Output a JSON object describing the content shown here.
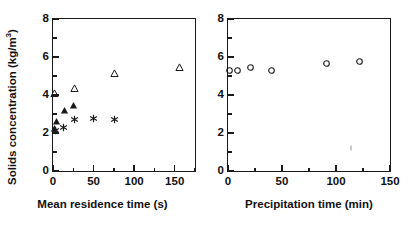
{
  "figure": {
    "background": "#ffffff",
    "foreground": "#1a1a1a"
  },
  "chart_data": [
    {
      "id": "left",
      "type": "scatter",
      "title": "",
      "xlabel": "Mean residence time (s)",
      "ylabel": "Solids concentration (kg/m",
      "ylabel_sup": "3",
      "ylabel_tail": ")",
      "ylabel_full": "Solids concentration (kg/m3 )",
      "xlim": [
        0,
        175
      ],
      "ylim": [
        0,
        8
      ],
      "xticks": [
        0,
        50,
        100,
        150
      ],
      "xticklabels": [
        "0",
        "50",
        "100",
        "150"
      ],
      "xminorticks": [
        25,
        75,
        125,
        175
      ],
      "yticks": [
        0,
        2,
        4,
        6,
        8
      ],
      "yticklabels": [
        "0",
        "2",
        "4",
        "6",
        "8"
      ],
      "yminorticks": [
        1,
        3,
        5,
        7
      ],
      "grid": false,
      "legend": "none",
      "series": [
        {
          "name": "open-triangle",
          "marker": "triangle-open",
          "color": "#1a1a1a",
          "points": [
            {
              "x": 1,
              "y": 4.1
            },
            {
              "x": 26,
              "y": 4.35
            },
            {
              "x": 75,
              "y": 5.15
            },
            {
              "x": 155,
              "y": 5.5
            }
          ]
        },
        {
          "name": "filled-triangle",
          "marker": "triangle-filled",
          "color": "#1a1a1a",
          "points": [
            {
              "x": 1,
              "y": 2.25
            },
            {
              "x": 4,
              "y": 2.65
            },
            {
              "x": 13,
              "y": 3.2
            },
            {
              "x": 25,
              "y": 3.5
            }
          ]
        },
        {
          "name": "asterisk",
          "marker": "asterisk",
          "color": "#1a1a1a",
          "points": [
            {
              "x": 2,
              "y": 2.15
            },
            {
              "x": 12,
              "y": 2.3
            },
            {
              "x": 26,
              "y": 2.75
            },
            {
              "x": 49,
              "y": 2.78
            },
            {
              "x": 75,
              "y": 2.72
            }
          ]
        }
      ]
    },
    {
      "id": "right",
      "type": "scatter",
      "title": "",
      "xlabel": "Precipitation time (min)",
      "ylabel": "",
      "xlim": [
        0,
        150
      ],
      "ylim": [
        0,
        8
      ],
      "xticks": [
        0,
        50,
        100,
        150
      ],
      "xticklabels": [
        "0",
        "50",
        "100",
        "150"
      ],
      "xminorticks": [
        25,
        75,
        125
      ],
      "yticks": [
        0,
        2,
        4,
        6,
        8
      ],
      "yticklabels": [
        "0",
        "2",
        "4",
        "6",
        "8"
      ],
      "yminorticks": [
        1,
        3,
        5,
        7
      ],
      "grid": false,
      "legend": "none",
      "series": [
        {
          "name": "open-circle",
          "marker": "circle-open",
          "color": "#1a1a1a",
          "points": [
            {
              "x": 1,
              "y": 5.3
            },
            {
              "x": 8,
              "y": 5.3
            },
            {
              "x": 20,
              "y": 5.5
            },
            {
              "x": 40,
              "y": 5.3
            },
            {
              "x": 91,
              "y": 5.68
            },
            {
              "x": 121,
              "y": 5.78
            }
          ]
        }
      ],
      "artifacts": [
        {
          "x": 114,
          "y": 1.2
        }
      ]
    }
  ]
}
